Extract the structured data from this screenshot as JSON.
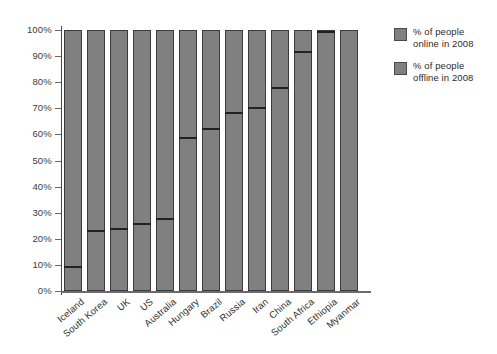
{
  "chart_data": {
    "type": "bar",
    "title": "",
    "subtitle": "",
    "xlabel": "",
    "ylabel": "",
    "stacked": true,
    "grid": false,
    "legend_position": "right",
    "ylim": [
      0,
      100
    ],
    "yticks": [
      "0%",
      "10%",
      "20%",
      "30%",
      "40%",
      "50%",
      "60%",
      "70%",
      "80%",
      "90%",
      "100%"
    ],
    "ytick_values": [
      0,
      10,
      20,
      30,
      40,
      50,
      60,
      70,
      80,
      90,
      100
    ],
    "categories": [
      "Iceland",
      "South Korea",
      "UK",
      "US",
      "Australia",
      "Hungary",
      "Brazil",
      "Russia",
      "Iran",
      "China",
      "South Africa",
      "Ethiopia",
      "Myanmar"
    ],
    "series": [
      {
        "name": "% of people online in 2008",
        "values": [
          9.5,
          23.5,
          24,
          26,
          28,
          59,
          62.5,
          68.5,
          70.5,
          78,
          92,
          99.5,
          100
        ]
      },
      {
        "name": "% of people offline in 2008",
        "values": [
          90.5,
          76.5,
          76,
          74,
          72,
          41,
          37.5,
          31.5,
          29.5,
          22,
          8,
          0.5,
          0
        ]
      }
    ],
    "colors": {
      "online": "#808080",
      "offline": "#808080",
      "bar_border": "#3b3b3b",
      "divider": "#222222",
      "axis": "#6a6a6a",
      "text": "#2e2e2e",
      "background": "#ffffff"
    }
  },
  "legend": {
    "items": [
      {
        "label_line1": "% of people",
        "label_line2": "online in 2008"
      },
      {
        "label_line1": "% of people",
        "label_line2": "offline in 2008"
      }
    ]
  }
}
